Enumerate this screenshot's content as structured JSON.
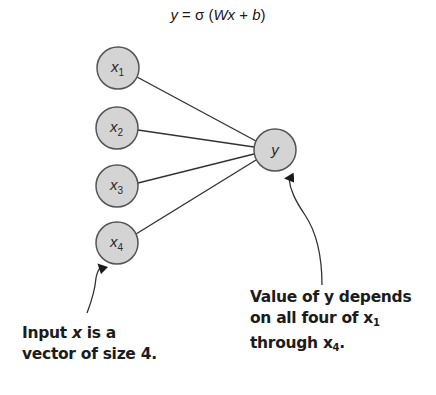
{
  "equation": {
    "lhs": "y",
    "eq": " = σ (",
    "W": "W",
    "x": "x",
    "plus": " + ",
    "b": "b",
    "close": ")"
  },
  "nodes": {
    "inputs": [
      {
        "id": "x1",
        "base": "x",
        "sub": "1",
        "cx": 118,
        "cy": 68
      },
      {
        "id": "x2",
        "base": "x",
        "sub": "2",
        "cx": 117,
        "cy": 128
      },
      {
        "id": "x3",
        "base": "x",
        "sub": "3",
        "cx": 117,
        "cy": 186
      },
      {
        "id": "x4",
        "base": "x",
        "sub": "4",
        "cx": 117,
        "cy": 243
      }
    ],
    "output": {
      "id": "y",
      "label": "y",
      "cx": 275,
      "cy": 150
    },
    "radius": 21,
    "fill": "#d4d4d4",
    "stroke": "#555555"
  },
  "callouts": {
    "input": {
      "line1_pre": "Input ",
      "line1_var": "x",
      "line1_post": " is a",
      "line2": "vector of size 4."
    },
    "output": {
      "line1": "Value of y depends",
      "line2_pre": "on all four of ",
      "line2_var": "x",
      "line2_sub": "1",
      "line3_pre": "through ",
      "line3_var": "x",
      "line3_sub": "4",
      "line3_post": "."
    }
  },
  "colors": {
    "edge": "#333333",
    "text": "#1c1c1c"
  }
}
